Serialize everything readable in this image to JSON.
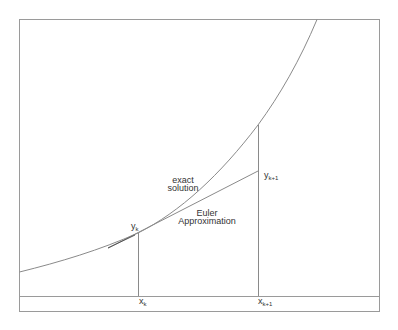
{
  "diagram": {
    "labels": {
      "exact_line1": "exact",
      "exact_line2": "solution",
      "euler_line1": "Euler",
      "euler_line2": "Approximation",
      "yk_base": "y",
      "yk_sub": "k",
      "yk1_base": "y",
      "yk1_sub": "k+1",
      "xk_base": "x",
      "xk_sub": "k",
      "xk1_base": "x",
      "xk1_sub": "k+1"
    },
    "colors": {
      "line": "#8a8a8a",
      "frame": "#9a9a9a",
      "text": "#333333"
    }
  }
}
